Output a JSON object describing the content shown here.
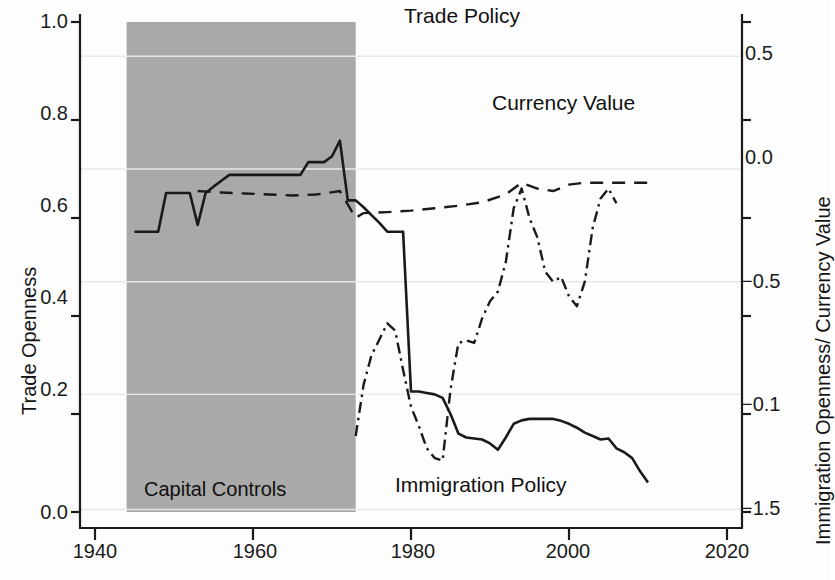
{
  "chart_data": {
    "type": "line",
    "title": "",
    "xlabel": "",
    "ylabel": "Trade Openness",
    "y2label": "Immigration Openness/ Currency Value",
    "xlim": [
      1938,
      2022
    ],
    "xticks": [
      1940,
      1960,
      1980,
      2000,
      2020
    ],
    "xticklabels": [
      "1940",
      "1960",
      "1980",
      "2000",
      "2020"
    ],
    "ylim": [
      0.0,
      1.0
    ],
    "yticks": [
      0.0,
      0.2,
      0.4,
      0.6,
      0.8,
      1.0
    ],
    "yticklabels": [
      "0.0",
      "0.2",
      "0.4",
      "0.6",
      "0.8",
      "1.0"
    ],
    "y2ticks_positions": [
      1.0,
      0.8,
      0.6,
      0.4,
      0.2
    ],
    "y2ticklabels": [
      "0.5",
      "0.0",
      "−0.5",
      "−0.1",
      "−1.5"
    ],
    "grid": true,
    "legend_position": "inline-annotations",
    "shaded_region": {
      "label": "Capital Controls",
      "x_start": 1944,
      "x_end": 1973,
      "color": "#a9a9a9"
    },
    "series": [
      {
        "name": "Trade Openness",
        "axis": "left",
        "style": "solid",
        "color": "#1a1a1a",
        "x": [
          1945,
          1946,
          1947,
          1948,
          1949,
          1950,
          1951,
          1952,
          1953,
          1954,
          1955,
          1956,
          1957,
          1958,
          1959,
          1960,
          1961,
          1962,
          1963,
          1964,
          1965,
          1966,
          1967,
          1968,
          1969,
          1970,
          1971,
          1972,
          1973,
          1974,
          1975,
          1976,
          1977,
          1978,
          1979,
          1980,
          1981,
          1982,
          1983,
          1984,
          1985,
          1986,
          1987,
          1988,
          1989,
          1990,
          1991,
          1992,
          1993,
          1994,
          1995,
          1996,
          1997,
          1998,
          1999,
          2000,
          2001,
          2002,
          2003,
          2004,
          2005,
          2006,
          2007,
          2008,
          2009,
          2010
        ],
        "values": [
          0.572,
          0.572,
          0.572,
          0.572,
          0.651,
          0.651,
          0.651,
          0.651,
          0.586,
          0.651,
          0.664,
          0.676,
          0.688,
          0.688,
          0.688,
          0.688,
          0.688,
          0.688,
          0.688,
          0.688,
          0.688,
          0.688,
          0.714,
          0.714,
          0.714,
          0.726,
          0.758,
          0.636,
          0.636,
          0.622,
          0.606,
          0.59,
          0.572,
          0.572,
          0.572,
          0.246,
          0.246,
          0.243,
          0.24,
          0.233,
          0.2,
          0.16,
          0.152,
          0.15,
          0.148,
          0.14,
          0.127,
          0.152,
          0.18,
          0.187,
          0.19,
          0.19,
          0.19,
          0.19,
          0.186,
          0.18,
          0.172,
          0.162,
          0.155,
          0.148,
          0.15,
          0.13,
          0.122,
          0.11,
          0.083,
          0.06
        ]
      },
      {
        "name": "Trade Policy",
        "axis": "right",
        "style": "dashed",
        "color": "#1a1a1a",
        "x": [
          1953,
          1956,
          1959,
          1962,
          1965,
          1968,
          1971,
          1973,
          1974,
          1977,
          1980,
          1983,
          1986,
          1989,
          1992,
          1994,
          1996,
          1998,
          2000,
          2002,
          2004,
          2006,
          2008,
          2010
        ],
        "values": [
          0.655,
          0.652,
          0.65,
          0.648,
          0.646,
          0.648,
          0.655,
          0.6,
          0.61,
          0.612,
          0.615,
          0.62,
          0.625,
          0.632,
          0.648,
          0.672,
          0.66,
          0.655,
          0.668,
          0.672,
          0.672,
          0.672,
          0.672,
          0.672
        ]
      },
      {
        "name": "Currency Value",
        "axis": "right",
        "style": "dash-dot",
        "color": "#1a1a1a",
        "x": [
          1973,
          1974,
          1975,
          1976,
          1977,
          1978,
          1979,
          1980,
          1981,
          1982,
          1983,
          1984,
          1985,
          1986,
          1987,
          1988,
          1989,
          1990,
          1991,
          1992,
          1993,
          1994,
          1995,
          1996,
          1997,
          1998,
          1999,
          2000,
          2001,
          2002,
          2003,
          2004,
          2005,
          2006
        ],
        "values": [
          0.155,
          0.26,
          0.32,
          0.352,
          0.385,
          0.37,
          0.29,
          0.215,
          0.175,
          0.13,
          0.11,
          0.105,
          0.25,
          0.345,
          0.35,
          0.345,
          0.395,
          0.43,
          0.45,
          0.51,
          0.62,
          0.66,
          0.6,
          0.56,
          0.49,
          0.47,
          0.48,
          0.44,
          0.42,
          0.47,
          0.58,
          0.64,
          0.66,
          0.63
        ]
      }
    ],
    "annotations": [
      {
        "text": "Trade Policy",
        "x": 1993,
        "y_px": 18
      },
      {
        "text": "Currency Value",
        "x": 1992,
        "y_px": 100
      },
      {
        "text": "Immigration Policy",
        "x": 1992,
        "y_px": 480
      },
      {
        "text": "Capital Controls",
        "x": 1958,
        "y_px": 487
      }
    ]
  },
  "axes": {
    "left_title": "Trade Openness",
    "right_title": "Immigration Openness/ Currency Value"
  },
  "ticks": {
    "left": [
      "1.0",
      "0.8",
      "0.6",
      "0.4",
      "0.2",
      "0.0"
    ],
    "right": [
      "0.5",
      "0.0",
      "−0.5",
      "−0.1",
      "−1.5"
    ],
    "bottom": [
      "1940",
      "1960",
      "1980",
      "2000",
      "2020"
    ]
  },
  "labels": {
    "trade_policy": "Trade Policy",
    "currency_value": "Currency Value",
    "immigration_policy": "Immigration Policy",
    "capital_controls": "Capital Controls"
  },
  "colors": {
    "ink": "#1a1a1a",
    "band": "#a9a9a9",
    "grid": "#e8e8e8",
    "background": "#fdfdfd"
  }
}
